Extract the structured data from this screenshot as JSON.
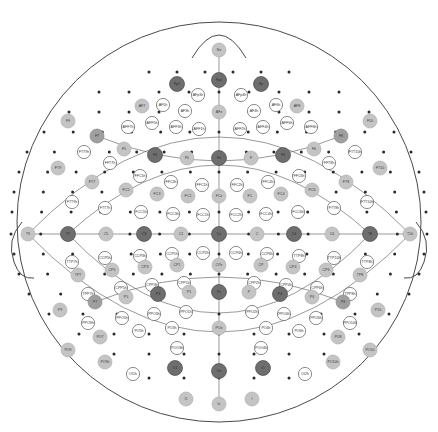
{
  "figure": {
    "type": "eeg-electrode-montage",
    "title": "",
    "system": "10-5 extended international electrode placement",
    "head_outline": {
      "cx": 219,
      "cy": 222,
      "rx": 202,
      "ry": 200,
      "nose_present": true,
      "left_ear_present": true,
      "right_ear_present": true,
      "stroke": "#4a4a4a"
    },
    "marker_styles": {
      "primary_10_20": {
        "fill": "#6e6e6e",
        "stroke": "#4a4a4a",
        "radius": 7.5,
        "text": "#2b2b2b"
      },
      "secondary_10_10": {
        "fill": "#9f9f9f",
        "stroke": "#8a8a8a",
        "radius": 7.0,
        "text": "#333333"
      },
      "tertiary_10_10_light": {
        "fill": "#c4c4c4",
        "stroke": "#b0b0b0",
        "radius": 7.0,
        "text": "#3a3a3a"
      },
      "intermediate_10_5": {
        "fill": "#ffffff",
        "stroke": "#5a5a5a",
        "radius": 6.6,
        "text": "#333333"
      },
      "dot_site": {
        "fill": "#2a2a2a",
        "radius": 1.5
      }
    },
    "label_font_size": 3.6,
    "chart_data": {
      "type": "scatter",
      "title": "10-5 EEG electrode montage",
      "xlabel": "",
      "ylabel": "",
      "legend": [],
      "electrodes": [
        {
          "label": "Nz",
          "x": 219,
          "y": 50,
          "style": "tertiary_10_10_light"
        },
        {
          "label": "Fp1",
          "x": 177,
          "y": 84,
          "style": "primary_10_20"
        },
        {
          "label": "Fpz",
          "x": 219,
          "y": 80,
          "style": "primary_10_20"
        },
        {
          "label": "Fp2",
          "x": 261,
          "y": 84,
          "style": "primary_10_20"
        },
        {
          "label": "AFp3h",
          "x": 198,
          "y": 95,
          "style": "intermediate_10_5"
        },
        {
          "label": "AFp4h",
          "x": 241,
          "y": 95,
          "style": "intermediate_10_5"
        },
        {
          "label": "AF7",
          "x": 142,
          "y": 106,
          "style": "tertiary_10_10_light"
        },
        {
          "label": "AF5h",
          "x": 163,
          "y": 105,
          "style": "intermediate_10_5"
        },
        {
          "label": "AF3h",
          "x": 185,
          "y": 111,
          "style": "intermediate_10_5"
        },
        {
          "label": "AFz",
          "x": 219,
          "y": 112,
          "style": "tertiary_10_10_light"
        },
        {
          "label": "AF4h",
          "x": 254,
          "y": 111,
          "style": "intermediate_10_5"
        },
        {
          "label": "AF6h",
          "x": 276,
          "y": 105,
          "style": "intermediate_10_5"
        },
        {
          "label": "AF8",
          "x": 297,
          "y": 106,
          "style": "tertiary_10_10_light"
        },
        {
          "label": "AFF7h",
          "x": 128,
          "y": 127,
          "style": "intermediate_10_5"
        },
        {
          "label": "AFF5h",
          "x": 152,
          "y": 123,
          "style": "intermediate_10_5"
        },
        {
          "label": "AFF3h",
          "x": 176,
          "y": 127,
          "style": "intermediate_10_5"
        },
        {
          "label": "AFF1h",
          "x": 199,
          "y": 129,
          "style": "intermediate_10_5"
        },
        {
          "label": "AFF2h",
          "x": 240,
          "y": 129,
          "style": "intermediate_10_5"
        },
        {
          "label": "AFF4h",
          "x": 263,
          "y": 127,
          "style": "intermediate_10_5"
        },
        {
          "label": "AFF6h",
          "x": 287,
          "y": 123,
          "style": "intermediate_10_5"
        },
        {
          "label": "AFF8h",
          "x": 311,
          "y": 127,
          "style": "intermediate_10_5"
        },
        {
          "label": "F9",
          "x": 68,
          "y": 121,
          "style": "tertiary_10_10_light"
        },
        {
          "label": "F7",
          "x": 97,
          "y": 136,
          "style": "secondary_10_10"
        },
        {
          "label": "F5",
          "x": 124,
          "y": 149,
          "style": "tertiary_10_10_light"
        },
        {
          "label": "F3",
          "x": 155,
          "y": 155,
          "style": "primary_10_20"
        },
        {
          "label": "F1",
          "x": 187,
          "y": 158,
          "style": "tertiary_10_10_light"
        },
        {
          "label": "Fz",
          "x": 219,
          "y": 158,
          "style": "primary_10_20"
        },
        {
          "label": "F2",
          "x": 251,
          "y": 158,
          "style": "tertiary_10_10_light"
        },
        {
          "label": "F4",
          "x": 283,
          "y": 155,
          "style": "primary_10_20"
        },
        {
          "label": "F6",
          "x": 314,
          "y": 149,
          "style": "tertiary_10_10_light"
        },
        {
          "label": "F8",
          "x": 341,
          "y": 136,
          "style": "secondary_10_10"
        },
        {
          "label": "F10",
          "x": 370,
          "y": 121,
          "style": "tertiary_10_10_light"
        },
        {
          "label": "FTT9h",
          "x": 84,
          "y": 152,
          "style": "intermediate_10_5"
        },
        {
          "label": "FFT7h",
          "x": 110,
          "y": 163,
          "style": "intermediate_10_5"
        },
        {
          "label": "FFC5h",
          "x": 140,
          "y": 176,
          "style": "intermediate_10_5"
        },
        {
          "label": "FFC3h",
          "x": 171,
          "y": 182,
          "style": "intermediate_10_5"
        },
        {
          "label": "FFC1h",
          "x": 202,
          "y": 185,
          "style": "intermediate_10_5"
        },
        {
          "label": "FFC2h",
          "x": 237,
          "y": 185,
          "style": "intermediate_10_5"
        },
        {
          "label": "FFC4h",
          "x": 268,
          "y": 182,
          "style": "intermediate_10_5"
        },
        {
          "label": "FFC6h",
          "x": 299,
          "y": 176,
          "style": "intermediate_10_5"
        },
        {
          "label": "FFT8h",
          "x": 329,
          "y": 163,
          "style": "intermediate_10_5"
        },
        {
          "label": "FTT10h",
          "x": 355,
          "y": 152,
          "style": "intermediate_10_5"
        },
        {
          "label": "FT9",
          "x": 58,
          "y": 168,
          "style": "tertiary_10_10_light"
        },
        {
          "label": "FT7",
          "x": 92,
          "y": 182,
          "style": "tertiary_10_10_light"
        },
        {
          "label": "FC5",
          "x": 126,
          "y": 190,
          "style": "tertiary_10_10_light"
        },
        {
          "label": "FC3",
          "x": 157,
          "y": 194,
          "style": "tertiary_10_10_light"
        },
        {
          "label": "FC1",
          "x": 188,
          "y": 196,
          "style": "tertiary_10_10_light"
        },
        {
          "label": "FCz",
          "x": 219,
          "y": 196,
          "style": "tertiary_10_10_light"
        },
        {
          "label": "FC2",
          "x": 250,
          "y": 196,
          "style": "tertiary_10_10_light"
        },
        {
          "label": "FC4",
          "x": 281,
          "y": 194,
          "style": "tertiary_10_10_light"
        },
        {
          "label": "FC6",
          "x": 312,
          "y": 190,
          "style": "tertiary_10_10_light"
        },
        {
          "label": "FT8",
          "x": 346,
          "y": 182,
          "style": "tertiary_10_10_light"
        },
        {
          "label": "FT10",
          "x": 380,
          "y": 168,
          "style": "tertiary_10_10_light"
        },
        {
          "label": "FTT9h",
          "x": 72,
          "y": 202,
          "style": "intermediate_10_5"
        },
        {
          "label": "FTT7h",
          "x": 105,
          "y": 208,
          "style": "intermediate_10_5"
        },
        {
          "label": "FCC5h",
          "x": 141,
          "y": 212,
          "style": "intermediate_10_5"
        },
        {
          "label": "FCC3h",
          "x": 173,
          "y": 214,
          "style": "intermediate_10_5"
        },
        {
          "label": "FCC1h",
          "x": 203,
          "y": 215,
          "style": "intermediate_10_5"
        },
        {
          "label": "FCC2h",
          "x": 236,
          "y": 215,
          "style": "intermediate_10_5"
        },
        {
          "label": "FCC4h",
          "x": 266,
          "y": 214,
          "style": "intermediate_10_5"
        },
        {
          "label": "FCC6h",
          "x": 298,
          "y": 212,
          "style": "intermediate_10_5"
        },
        {
          "label": "FTT8h",
          "x": 334,
          "y": 208,
          "style": "intermediate_10_5"
        },
        {
          "label": "FTT10h",
          "x": 367,
          "y": 202,
          "style": "intermediate_10_5"
        },
        {
          "label": "T9",
          "x": 28,
          "y": 234,
          "style": "tertiary_10_10_light"
        },
        {
          "label": "T7",
          "x": 68,
          "y": 234,
          "style": "primary_10_20"
        },
        {
          "label": "C5",
          "x": 106,
          "y": 234,
          "style": "tertiary_10_10_light"
        },
        {
          "label": "C3",
          "x": 144,
          "y": 234,
          "style": "primary_10_20"
        },
        {
          "label": "C1",
          "x": 181,
          "y": 234,
          "style": "tertiary_10_10_light"
        },
        {
          "label": "Cz",
          "x": 219,
          "y": 234,
          "style": "primary_10_20"
        },
        {
          "label": "C2",
          "x": 257,
          "y": 234,
          "style": "tertiary_10_10_light"
        },
        {
          "label": "C4",
          "x": 294,
          "y": 234,
          "style": "primary_10_20"
        },
        {
          "label": "C6",
          "x": 332,
          "y": 234,
          "style": "tertiary_10_10_light"
        },
        {
          "label": "T8",
          "x": 370,
          "y": 234,
          "style": "primary_10_20"
        },
        {
          "label": "T10",
          "x": 410,
          "y": 234,
          "style": "tertiary_10_10_light"
        },
        {
          "label": "TTP7h",
          "x": 72,
          "y": 262,
          "style": "intermediate_10_5"
        },
        {
          "label": "CCP5h",
          "x": 105,
          "y": 258,
          "style": "intermediate_10_5"
        },
        {
          "label": "CCP3h",
          "x": 140,
          "y": 256,
          "style": "intermediate_10_5"
        },
        {
          "label": "CCP1h",
          "x": 172,
          "y": 254,
          "style": "intermediate_10_5"
        },
        {
          "label": "CCP2h",
          "x": 203,
          "y": 253,
          "style": "intermediate_10_5"
        },
        {
          "label": "CCP4h",
          "x": 236,
          "y": 253,
          "style": "intermediate_10_5"
        },
        {
          "label": "CCP6h",
          "x": 267,
          "y": 254,
          "style": "intermediate_10_5"
        },
        {
          "label": "TTP8h",
          "x": 299,
          "y": 256,
          "style": "intermediate_10_5"
        },
        {
          "label": "TTP10h",
          "x": 334,
          "y": 258,
          "style": "intermediate_10_5"
        },
        {
          "label": "TTP8h2",
          "x": 367,
          "y": 262,
          "style": "intermediate_10_5"
        },
        {
          "label": "TP7",
          "x": 78,
          "y": 275,
          "style": "tertiary_10_10_light"
        },
        {
          "label": "CP5",
          "x": 112,
          "y": 270,
          "style": "tertiary_10_10_light"
        },
        {
          "label": "CP3",
          "x": 145,
          "y": 267,
          "style": "tertiary_10_10_light"
        },
        {
          "label": "CP1",
          "x": 177,
          "y": 265,
          "style": "tertiary_10_10_light"
        },
        {
          "label": "CPz",
          "x": 219,
          "y": 265,
          "style": "tertiary_10_10_light"
        },
        {
          "label": "CP2",
          "x": 261,
          "y": 265,
          "style": "tertiary_10_10_light"
        },
        {
          "label": "CP4",
          "x": 293,
          "y": 267,
          "style": "tertiary_10_10_light"
        },
        {
          "label": "CP6",
          "x": 326,
          "y": 270,
          "style": "tertiary_10_10_light"
        },
        {
          "label": "TP8",
          "x": 360,
          "y": 275,
          "style": "tertiary_10_10_light"
        },
        {
          "label": "TPP7h",
          "x": 88,
          "y": 294,
          "style": "intermediate_10_5"
        },
        {
          "label": "CPP5h",
          "x": 121,
          "y": 288,
          "style": "intermediate_10_5"
        },
        {
          "label": "CPP3h",
          "x": 152,
          "y": 285,
          "style": "intermediate_10_5"
        },
        {
          "label": "CPP1h",
          "x": 184,
          "y": 283,
          "style": "intermediate_10_5"
        },
        {
          "label": "CPP2h",
          "x": 254,
          "y": 283,
          "style": "intermediate_10_5"
        },
        {
          "label": "CPP4h",
          "x": 286,
          "y": 285,
          "style": "intermediate_10_5"
        },
        {
          "label": "CPP6h",
          "x": 317,
          "y": 288,
          "style": "intermediate_10_5"
        },
        {
          "label": "TPP8h",
          "x": 350,
          "y": 294,
          "style": "intermediate_10_5"
        },
        {
          "label": "P9",
          "x": 60,
          "y": 310,
          "style": "tertiary_10_10_light"
        },
        {
          "label": "P7",
          "x": 95,
          "y": 302,
          "style": "secondary_10_10"
        },
        {
          "label": "P5",
          "x": 126,
          "y": 297,
          "style": "tertiary_10_10_light"
        },
        {
          "label": "P3",
          "x": 158,
          "y": 294,
          "style": "primary_10_20"
        },
        {
          "label": "P1",
          "x": 189,
          "y": 292,
          "style": "tertiary_10_10_light"
        },
        {
          "label": "Pz",
          "x": 219,
          "y": 292,
          "style": "primary_10_20"
        },
        {
          "label": "P2",
          "x": 249,
          "y": 292,
          "style": "tertiary_10_10_light"
        },
        {
          "label": "P4",
          "x": 280,
          "y": 294,
          "style": "primary_10_20"
        },
        {
          "label": "P6",
          "x": 312,
          "y": 297,
          "style": "tertiary_10_10_light"
        },
        {
          "label": "P8",
          "x": 343,
          "y": 302,
          "style": "secondary_10_10"
        },
        {
          "label": "P10",
          "x": 378,
          "y": 310,
          "style": "tertiary_10_10_light"
        },
        {
          "label": "PPO9h",
          "x": 88,
          "y": 323,
          "style": "intermediate_10_5"
        },
        {
          "label": "PPO5h",
          "x": 122,
          "y": 318,
          "style": "intermediate_10_5"
        },
        {
          "label": "PPO3h",
          "x": 154,
          "y": 314,
          "style": "intermediate_10_5"
        },
        {
          "label": "PPO1h",
          "x": 186,
          "y": 312,
          "style": "intermediate_10_5"
        },
        {
          "label": "PPO2h",
          "x": 252,
          "y": 312,
          "style": "intermediate_10_5"
        },
        {
          "label": "PPO4h",
          "x": 284,
          "y": 314,
          "style": "intermediate_10_5"
        },
        {
          "label": "PPO6h",
          "x": 316,
          "y": 318,
          "style": "intermediate_10_5"
        },
        {
          "label": "PPO10h",
          "x": 350,
          "y": 323,
          "style": "intermediate_10_5"
        },
        {
          "label": "PO7",
          "x": 100,
          "y": 337,
          "style": "tertiary_10_10_light"
        },
        {
          "label": "PO5h",
          "x": 139,
          "y": 331,
          "style": "intermediate_10_5"
        },
        {
          "label": "PO3h",
          "x": 172,
          "y": 328,
          "style": "intermediate_10_5"
        },
        {
          "label": "POz",
          "x": 219,
          "y": 328,
          "style": "tertiary_10_10_light"
        },
        {
          "label": "PO4h",
          "x": 266,
          "y": 328,
          "style": "intermediate_10_5"
        },
        {
          "label": "PO6h",
          "x": 299,
          "y": 331,
          "style": "intermediate_10_5"
        },
        {
          "label": "PO8",
          "x": 338,
          "y": 337,
          "style": "tertiary_10_10_light"
        },
        {
          "label": "POO3h",
          "x": 177,
          "y": 348,
          "style": "intermediate_10_5"
        },
        {
          "label": "POO4h",
          "x": 261,
          "y": 348,
          "style": "intermediate_10_5"
        },
        {
          "label": "PO9",
          "x": 68,
          "y": 350,
          "style": "tertiary_10_10_light"
        },
        {
          "label": "PO10",
          "x": 370,
          "y": 350,
          "style": "tertiary_10_10_light"
        },
        {
          "label": "O1",
          "x": 175,
          "y": 368,
          "style": "primary_10_20"
        },
        {
          "label": "Oz",
          "x": 219,
          "y": 371,
          "style": "primary_10_20"
        },
        {
          "label": "O2",
          "x": 263,
          "y": 368,
          "style": "primary_10_20"
        },
        {
          "label": "OI1h",
          "x": 133,
          "y": 374,
          "style": "intermediate_10_5"
        },
        {
          "label": "OI2h",
          "x": 305,
          "y": 374,
          "style": "intermediate_10_5"
        },
        {
          "label": "I1",
          "x": 186,
          "y": 399,
          "style": "tertiary_10_10_light"
        },
        {
          "label": "Iz",
          "x": 219,
          "y": 404,
          "style": "tertiary_10_10_light"
        },
        {
          "label": "I2",
          "x": 252,
          "y": 399,
          "style": "tertiary_10_10_light"
        },
        {
          "label": "PO9h",
          "x": 105,
          "y": 362,
          "style": "tertiary_10_10_light"
        },
        {
          "label": "PO10h",
          "x": 333,
          "y": 362,
          "style": "tertiary_10_10_light"
        }
      ],
      "contour_arcs": [
        {
          "name": "nose-arc"
        },
        {
          "name": "frontal-arc"
        },
        {
          "name": "coronal-arc"
        },
        {
          "name": "parietal-arc"
        },
        {
          "name": "occipital-arc"
        },
        {
          "name": "sagittal-midline"
        }
      ],
      "dot_sites_count": 120
    }
  }
}
